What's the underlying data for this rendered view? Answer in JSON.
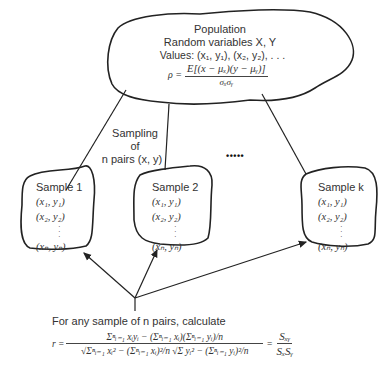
{
  "population": {
    "title": "Population",
    "line2": "Random variables X, Y",
    "line3": "Values: (x₁, y₁), (x₂, y₂), . . .",
    "rho_label": "ρ =",
    "rho_numerator": "E[(x − μₓ)(y − μᵧ)]",
    "rho_denominator": "σₓσᵧ"
  },
  "sampling_label": {
    "line1": "Sampling",
    "line2": "of",
    "line3": "n pairs (x, y)"
  },
  "ellipsis": "• • • • •",
  "samples": [
    {
      "title": "Sample 1",
      "rows": [
        "(x₁, y₁)",
        "(x₂, y₂)",
        "(xₙ, yₙ)"
      ]
    },
    {
      "title": "Sample 2",
      "rows": [
        "(x₁, y₁)",
        "(x₂, y₂)",
        "(xₙ, yₙ)"
      ]
    },
    {
      "title": "Sample k",
      "rows": [
        "(x₁, y₁)",
        "(x₂, y₂)",
        "(xₙ, yₙ)"
      ]
    }
  ],
  "calculation": {
    "caption": "For any sample of n pairs, calculate",
    "r_label": "r =",
    "numerator": "Σⁿᵢ₌₁ xᵢyᵢ − (Σⁿᵢ₌₁ xᵢ)(Σⁿᵢ₌₁ yᵢ)/n",
    "denominator": "√Σⁿᵢ₌₁ xᵢ² − (Σⁿᵢ₌₁ xᵢ)²/n √Σ yᵢ² − (Σⁿᵢ₌₁ yᵢ)²/n",
    "equals": "=",
    "rhs_numerator": "Sₓᵧ",
    "rhs_denominator": "SₓSᵧ"
  }
}
